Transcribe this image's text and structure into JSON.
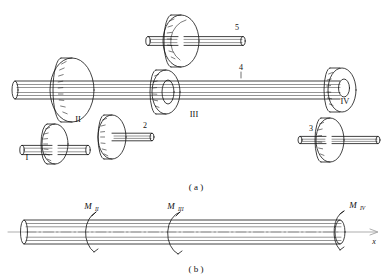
{
  "figure": {
    "type": "engineering-diagram",
    "panels": [
      {
        "caption": "( a )",
        "description": "gear-shaft assembly",
        "shaft_label": "4",
        "stations": [
          {
            "id": "station-1",
            "label": "I"
          },
          {
            "id": "station-2",
            "label": "II"
          },
          {
            "id": "station-3",
            "label": "III"
          },
          {
            "id": "station-4",
            "label": "IV"
          }
        ],
        "gears": [
          {
            "id": "gear-1",
            "label": "1"
          },
          {
            "id": "gear-2",
            "label": "2"
          },
          {
            "id": "gear-3",
            "label": "3"
          },
          {
            "id": "gear-5",
            "label": "5"
          }
        ]
      },
      {
        "caption": "( b )",
        "description": "equivalent torsion shaft free body",
        "axis_label": "x",
        "moments": [
          {
            "id": "moment-2",
            "symbol": "M",
            "subscript": "II"
          },
          {
            "id": "moment-3",
            "symbol": "M",
            "subscript": "III"
          },
          {
            "id": "moment-4",
            "symbol": "M",
            "subscript": "IV"
          }
        ]
      }
    ],
    "colors": {
      "line": "#111111",
      "background": "#ffffff",
      "axis": "#8a8a8a"
    }
  }
}
